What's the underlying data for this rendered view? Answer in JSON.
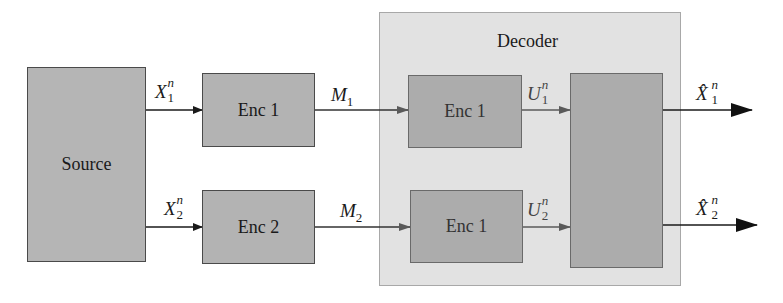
{
  "diagram": {
    "source": {
      "label": "Source"
    },
    "encoders": [
      {
        "label": "Enc 1",
        "input": {
          "base": "X",
          "sub": "1",
          "sup": "n"
        },
        "output": {
          "base": "M",
          "sub": "1"
        }
      },
      {
        "label": "Enc 2",
        "input": {
          "base": "X",
          "sub": "2",
          "sup": "n"
        },
        "output": {
          "base": "M",
          "sub": "2"
        }
      }
    ],
    "decoder": {
      "title": "Decoder",
      "inner_blocks": [
        {
          "label": "Enc 1",
          "output": {
            "base": "U",
            "sub": "1",
            "sup": "n"
          }
        },
        {
          "label": "Enc 1",
          "output": {
            "base": "U",
            "sub": "2",
            "sup": "n"
          }
        }
      ],
      "combiner": {
        "label": ""
      }
    },
    "outputs": [
      {
        "base": "X̂",
        "sub": "1",
        "sup": "n"
      },
      {
        "base": "X̂",
        "sub": "2",
        "sup": "n"
      }
    ],
    "colors": {
      "block_fill": "#b3b3b3",
      "block_border": "#4a4a4a",
      "decoder_fill": "#e2e2e2",
      "decoder_border": "#a8a8a8",
      "inner_fill": "#acacac",
      "arrow": "#1a1a1a"
    }
  }
}
